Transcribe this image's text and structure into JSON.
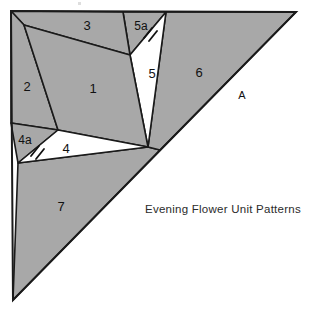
{
  "figure": {
    "caption": "Evening Flower Unit Patterns",
    "caption_position": {
      "x": 145,
      "y": 210
    },
    "edge_label": {
      "text": "A",
      "x": 242,
      "y": 96
    },
    "colors": {
      "shaded": "#a8a8a8",
      "unshaded": "#ffffff",
      "stroke": "#1a1a1a",
      "background": "#ffffff",
      "text": "#111111",
      "caption": "#2b2b2b"
    },
    "outline": {
      "name": "right-triangle-outline",
      "points": "11,11 296,12 13,300",
      "description": "large right triangle, vertical left edge, horizontal top edge, hypotenuse from top-right to bottom-left"
    },
    "regions": [
      {
        "id": "1",
        "label": "1",
        "shaded": true,
        "label_x": 93,
        "label_y": 90,
        "points": "24,25 58,130 130,55"
      },
      {
        "id": "2",
        "label": "2",
        "shaded": true,
        "label_x": 27,
        "label_y": 88,
        "points": "11,11 24,25 58,130 11,123"
      },
      {
        "id": "3",
        "label": "3",
        "shaded": true,
        "label_x": 87,
        "label_y": 27,
        "points": "11,11 24,25 130,55 123,12"
      },
      {
        "id": "4",
        "label": "4",
        "shaded": false,
        "label_x": 66,
        "label_y": 150,
        "points": "58,130 148,147 18,163"
      },
      {
        "id": "4a",
        "label": "4a",
        "shaded": true,
        "label_x": 24,
        "label_y": 141,
        "points": "11,123 58,130 18,163"
      },
      {
        "id": "5",
        "label": "5",
        "shaded": false,
        "label_x": 152,
        "label_y": 75,
        "points": "130,55 166,12 148,147"
      },
      {
        "id": "5a",
        "label": "5a",
        "shaded": true,
        "label_x": 140,
        "label_y": 27,
        "points": "123,12 166,12 130,55"
      },
      {
        "id": "6",
        "label": "6",
        "shaded": true,
        "label_x": 199,
        "label_y": 74,
        "points": "166,12 296,12 160,150 148,147"
      },
      {
        "id": "7",
        "label": "7",
        "shaded": true,
        "label_x": 61,
        "label_y": 208,
        "points": "18,163 148,147 160,150 13,300"
      }
    ],
    "tick_marks": [
      {
        "name": "tick-mark-5a",
        "description": "double hash mark on edge between 5a and 5",
        "x1": 142,
        "y1": 38,
        "x2": 155,
        "y2": 28
      },
      {
        "name": "tick-mark-4a",
        "description": "double hash mark on edge between 4a and 4",
        "x1": 31,
        "y1": 155,
        "x2": 43,
        "y2": 146
      }
    ]
  }
}
